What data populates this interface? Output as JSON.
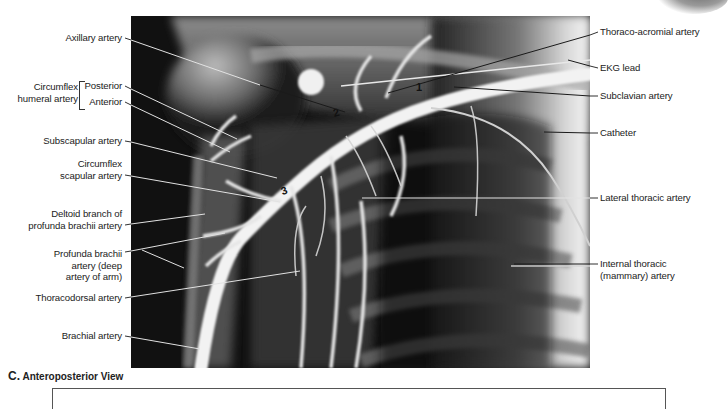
{
  "figure": {
    "panel_letter": "C.",
    "view_title": "Anteroposterior View",
    "image_description": "Subclavian/axillary arteriogram of right shoulder region",
    "segment_numbers": [
      "1",
      "2",
      "3"
    ]
  },
  "left_labels": {
    "axillary": "Axillary artery",
    "circumflex_group": [
      "Circumflex",
      "humeral artery"
    ],
    "posterior": "Posterior",
    "anterior": "Anterior",
    "subscapular": "Subscapular artery",
    "circumflex_scapular": [
      "Circumflex",
      "scapular artery"
    ],
    "deltoid_branch": [
      "Deltoid branch of",
      "profunda brachii artery"
    ],
    "profunda_brachii": [
      "Profunda brachii",
      "artery (deep",
      "artery of arm)"
    ],
    "thoracodorsal": "Thoracodorsal artery",
    "brachial": "Brachial artery"
  },
  "right_labels": {
    "thoraco_acromial": "Thoraco-acromial artery",
    "ekg_lead": "EKG lead",
    "subclavian": "Subclavian artery",
    "catheter": "Catheter",
    "lateral_thoracic": "Lateral thoracic artery",
    "internal_thoracic": [
      "Internal thoracic",
      "(mammary) artery"
    ]
  },
  "colors": {
    "label_text": "#222222",
    "leader_line_dark": "#1a1a1a",
    "leader_line_light": "#e8e8e8",
    "xray_background": "#0a0a0a"
  }
}
